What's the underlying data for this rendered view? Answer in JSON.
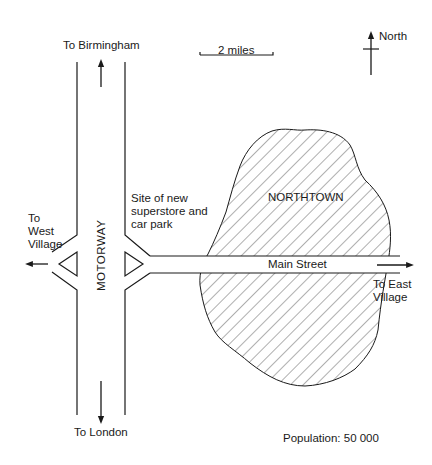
{
  "map": {
    "town": {
      "name": "NORTHTOWN",
      "population_label": "Population: 50 000"
    },
    "roads": {
      "motorway": "MOTORWAY",
      "main_street": "Main Street"
    },
    "destinations": {
      "north": "To Birmingham",
      "south": "To London",
      "west_line1": "To",
      "west_line2": "West",
      "west_line3": "Village",
      "east_line1": "To East",
      "east_line2": "Village"
    },
    "site": {
      "line1": "Site of new",
      "line2": "superstore and",
      "line3": "car park"
    },
    "scale": {
      "label": "2 miles"
    },
    "compass": {
      "label": "North"
    },
    "colors": {
      "ink": "#1a1a1a",
      "background": "#ffffff"
    }
  }
}
